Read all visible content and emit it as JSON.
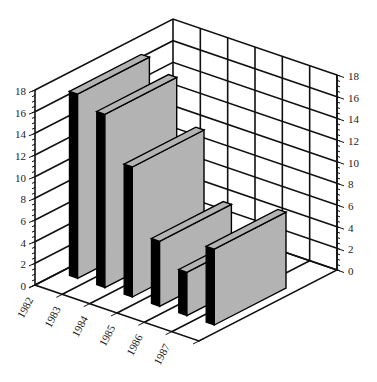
{
  "chart_data": {
    "type": "bar",
    "subtype": "3d-bar",
    "title": "",
    "xlabel": "",
    "ylabel": "",
    "categories": [
      "1982",
      "1983",
      "1984",
      "1985",
      "1986",
      "1987"
    ],
    "values": [
      17,
      16,
      12,
      6,
      4,
      7
    ],
    "ylim": [
      0,
      18
    ],
    "y_ticks": [
      0,
      2,
      4,
      6,
      8,
      10,
      12,
      14,
      16,
      18
    ],
    "y_minor_tick_step": 0.5,
    "grid": true,
    "legend": null,
    "axes": {
      "left_value_axis": true,
      "right_value_axis": true
    },
    "colors": {
      "bar_front": "#b3b3b3",
      "bar_side": "#000000",
      "bar_top": "#b3b3b3",
      "grid": "#111111",
      "background": "#ffffff"
    }
  }
}
